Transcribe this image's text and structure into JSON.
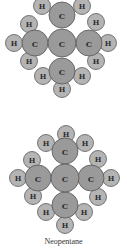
{
  "figure": {
    "caption": "Neopentane",
    "atom_labels": {
      "carbon": "C",
      "hydrogen": "H"
    },
    "colors": {
      "carbon": "#9a9a9a",
      "hydrogen": "#b4b4b4",
      "outline": "#555555"
    },
    "molecules": [
      {
        "name": "neopentane-model-top",
        "carbons": [
          {
            "x": 62,
            "y": 43,
            "r": 14
          },
          {
            "x": 62,
            "y": 15,
            "r": 13
          },
          {
            "x": 35,
            "y": 43,
            "r": 13
          },
          {
            "x": 89,
            "y": 43,
            "r": 13
          },
          {
            "x": 62,
            "y": 71,
            "r": 13
          }
        ],
        "hydrogens": [
          {
            "x": 42,
            "y": 6
          },
          {
            "x": 82,
            "y": 6
          },
          {
            "x": 29,
            "y": 24
          },
          {
            "x": 14,
            "y": 43
          },
          {
            "x": 29,
            "y": 61
          },
          {
            "x": 96,
            "y": 22
          },
          {
            "x": 108,
            "y": 43
          },
          {
            "x": 96,
            "y": 61
          },
          {
            "x": 43,
            "y": 76
          },
          {
            "x": 82,
            "y": 76
          },
          {
            "x": 62,
            "y": 89
          }
        ]
      },
      {
        "name": "neopentane-model-bottom",
        "carbons": [
          {
            "x": 65,
            "y": 178,
            "r": 14
          },
          {
            "x": 65,
            "y": 151,
            "r": 13
          },
          {
            "x": 38,
            "y": 178,
            "r": 13
          },
          {
            "x": 91,
            "y": 178,
            "r": 13
          },
          {
            "x": 65,
            "y": 205,
            "r": 13
          }
        ],
        "hydrogens": [
          {
            "x": 66,
            "y": 134
          },
          {
            "x": 46,
            "y": 143
          },
          {
            "x": 85,
            "y": 143
          },
          {
            "x": 32,
            "y": 160
          },
          {
            "x": 18,
            "y": 178
          },
          {
            "x": 33,
            "y": 196
          },
          {
            "x": 98,
            "y": 159
          },
          {
            "x": 111,
            "y": 178
          },
          {
            "x": 98,
            "y": 197
          },
          {
            "x": 46,
            "y": 212
          },
          {
            "x": 84,
            "y": 212
          },
          {
            "x": 65,
            "y": 225
          }
        ]
      }
    ]
  }
}
